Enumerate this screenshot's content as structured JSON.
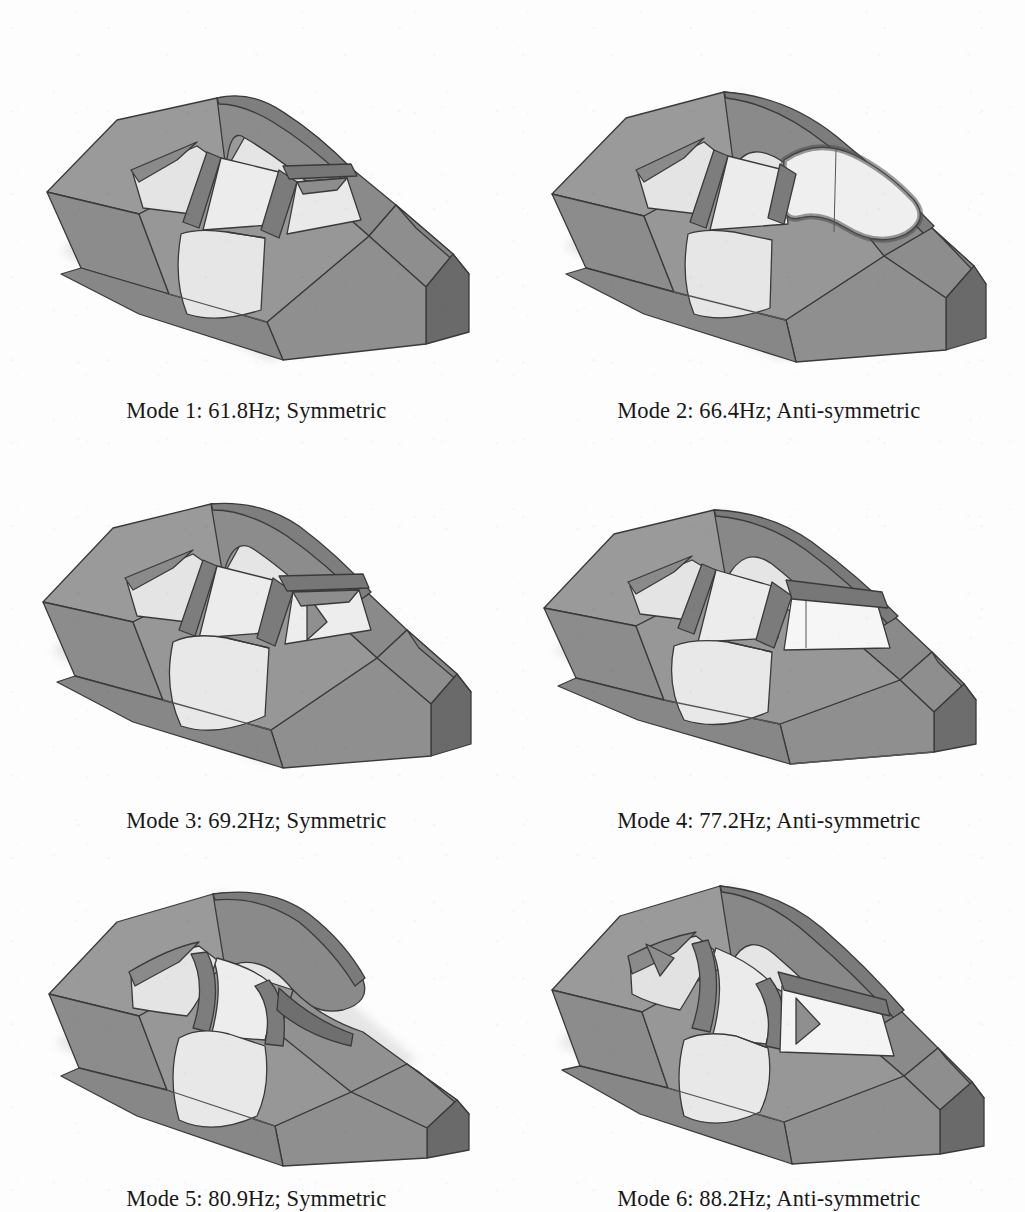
{
  "page": {
    "kind": "figure-grid",
    "background_color": "#fdfdfd",
    "columns": 2,
    "rows": 3
  },
  "palette": {
    "roof_light": "#9b9b9b",
    "roof_mid": "#8e8e8e",
    "body_side": "#9a9a9a",
    "body_side_dark": "#838383",
    "hood": "#8a8a8a",
    "front_face_dark": "#6d6d6d",
    "rear_face_dark": "#6a6a6a",
    "glass": "#e6e6e6",
    "glass_bright": "#f2f2f2",
    "door_panel": "#e0e0e0",
    "pillar": "#7d7d7d",
    "outline": "#3a3a3a",
    "text": "#181818",
    "shadow": "#d8d8d8"
  },
  "figures": [
    {
      "id": "mode-1",
      "caption": "Mode 1: 61.8Hz; Symmetric",
      "mode_number": 1,
      "frequency_hz": 61.8,
      "frequency_label": "61.8Hz",
      "symmetry": "Symmetric",
      "description": "Finite element car body mode shape, roof bowed upward symmetrically"
    },
    {
      "id": "mode-2",
      "caption": "Mode 2: 66.4Hz; Anti-symmetric",
      "mode_number": 2,
      "frequency_hz": 66.4,
      "frequency_label": "66.4Hz",
      "symmetry": "Anti-symmetric",
      "description": "Finite element car body mode shape, roof twisted with wavy windscreen opening"
    },
    {
      "id": "mode-3",
      "caption": "Mode 3: 69.2Hz; Symmetric",
      "mode_number": 3,
      "frequency_hz": 69.2,
      "frequency_label": "69.2Hz",
      "symmetry": "Symmetric",
      "description": "Finite element car body mode shape, symmetric roof and side panel bending"
    },
    {
      "id": "mode-4",
      "caption": "Mode 4: 77.2Hz; Anti-symmetric",
      "mode_number": 4,
      "frequency_hz": 77.2,
      "frequency_label": "77.2Hz",
      "symmetry": "Anti-symmetric",
      "description": "Finite element car body mode shape, anti-symmetric torsion of cabin"
    },
    {
      "id": "mode-5",
      "caption": "Mode 5: 80.9Hz; Symmetric",
      "mode_number": 5,
      "frequency_hz": 80.9,
      "frequency_label": "80.9Hz",
      "symmetry": "Symmetric",
      "description": "Finite element car body mode shape, strongly domed roof, symmetric"
    },
    {
      "id": "mode-6",
      "caption": "Mode 6: 88.2Hz; Anti-symmetric",
      "mode_number": 6,
      "frequency_hz": 88.2,
      "frequency_label": "88.2Hz",
      "symmetry": "Anti-symmetric",
      "description": "Finite element car body mode shape, anti-symmetric roof saddle deformation"
    }
  ]
}
